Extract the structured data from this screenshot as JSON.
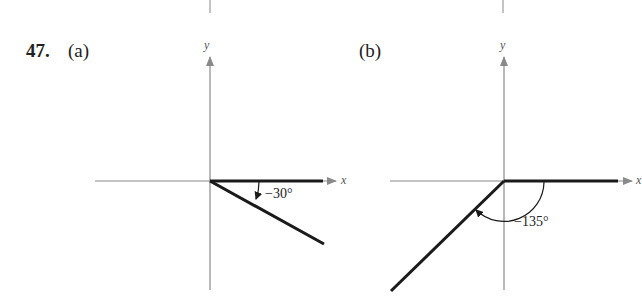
{
  "problem": {
    "number": "47.",
    "parts": [
      {
        "label": "(a)",
        "angle_label": "−30°",
        "angle_degrees": -30,
        "x_axis_label": "x",
        "y_axis_label": "y"
      },
      {
        "label": "(b)",
        "angle_label": "−135°",
        "angle_degrees": -135,
        "x_axis_label": "x",
        "y_axis_label": "y"
      }
    ]
  },
  "colors": {
    "axis": "#8a8a8a",
    "ray": "#1a1a1a",
    "text": "#222222"
  }
}
